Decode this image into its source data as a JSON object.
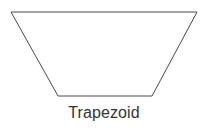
{
  "figure": {
    "name": "trapezoid-figure",
    "background_color": "#ffffff",
    "width": 208,
    "height": 134,
    "shape": {
      "kind": "trapezoid",
      "stroke_color": "#4a4a4a",
      "stroke_width": 1,
      "fill_color": "none",
      "points": "11,12 197,12 152,96 58,96",
      "vertices": [
        {
          "label": "top-left",
          "x": 11,
          "y": 12
        },
        {
          "label": "top-right",
          "x": 197,
          "y": 12
        },
        {
          "label": "bottom-right",
          "x": 152,
          "y": 96
        },
        {
          "label": "bottom-left",
          "x": 58,
          "y": 96
        }
      ],
      "edges": [
        {
          "label": "top-base",
          "length_px": 186
        },
        {
          "label": "right-leg",
          "length_px": 95
        },
        {
          "label": "bottom-base",
          "length_px": 94
        },
        {
          "label": "left-leg",
          "length_px": 95
        }
      ]
    },
    "label": {
      "text": "Trapezoid",
      "color": "#333333",
      "font_size_px": 16
    }
  }
}
